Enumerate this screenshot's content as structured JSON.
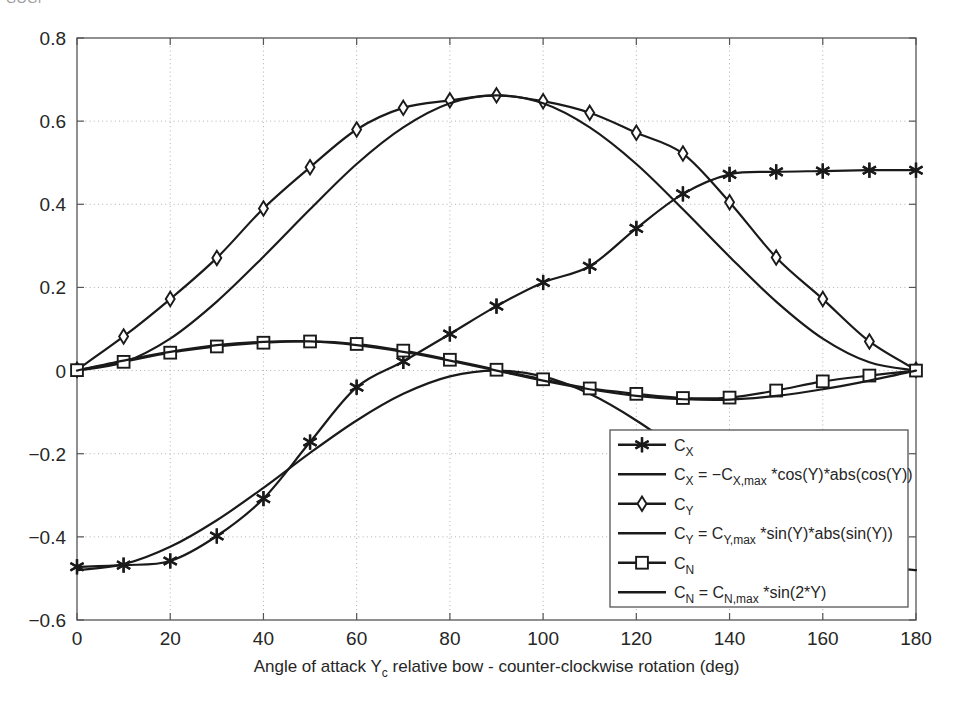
{
  "clipped_header_text": "GOGI",
  "chart_data": {
    "type": "line",
    "title": "",
    "xlabel": "Angle of attack Yₑ relative bow - counter-clockwise rotation (deg)",
    "xlabel_parts": {
      "pre": "Angle of attack Y",
      "sub": "c",
      "post": " relative bow - counter-clockwise rotation (deg)"
    },
    "ylabel": "",
    "xlim": [
      0,
      180
    ],
    "ylim": [
      -0.6,
      0.8
    ],
    "xticks": [
      0,
      20,
      40,
      60,
      80,
      100,
      120,
      140,
      160,
      180
    ],
    "xtick_labels": [
      "0",
      "20",
      "40",
      "60",
      "80",
      "100",
      "120",
      "140",
      "160",
      "180"
    ],
    "yticks": [
      -0.6,
      -0.4,
      -0.2,
      0,
      0.2,
      0.4,
      0.6,
      0.8
    ],
    "ytick_labels": [
      "-0.6",
      "-0.4",
      "-0.2",
      "0",
      "0.2",
      "0.4",
      "0.6",
      "0.8"
    ],
    "grid": true,
    "grid_style": "dotted",
    "legend_position": "lower-right",
    "x": [
      0,
      10,
      20,
      30,
      40,
      50,
      60,
      70,
      80,
      90,
      100,
      110,
      120,
      130,
      140,
      150,
      160,
      170,
      180
    ],
    "series": [
      {
        "name": "C_X",
        "legend": "Cₓ",
        "marker": "asterisk-marker",
        "style": "marker-line",
        "values": [
          -0.472,
          -0.468,
          -0.458,
          -0.398,
          -0.308,
          -0.172,
          -0.04,
          0.022,
          0.088,
          0.155,
          0.212,
          0.251,
          0.342,
          0.425,
          0.472,
          0.478,
          0.48,
          0.482,
          0.482
        ]
      },
      {
        "name": "C_X_fit",
        "legend": "Cₓ = −Cₓ,ₘₐₓ*cos(Y)*abs(cos(Y))",
        "legend_parts": {
          "pre": "C",
          "sub1": "X",
          "mid": " = −C",
          "sub2": "X,max",
          "post": " *cos(Y)*abs(cos(Y))"
        },
        "marker": "none",
        "style": "line",
        "formula": "-Cx_max*cos(Y)*abs(cos(Y))",
        "amplitude": 0.48,
        "values": [
          -0.48,
          -0.466,
          -0.424,
          -0.36,
          -0.282,
          -0.198,
          -0.12,
          -0.056,
          -0.014,
          0.0,
          -0.014,
          -0.056,
          -0.12,
          -0.198,
          -0.282,
          -0.36,
          -0.424,
          -0.466,
          -0.48
        ]
      },
      {
        "name": "C_Y",
        "legend": "Cᵧ",
        "marker": "diamond-marker",
        "style": "marker-line",
        "values": [
          0.002,
          0.082,
          0.172,
          0.271,
          0.39,
          0.489,
          0.58,
          0.632,
          0.65,
          0.662,
          0.648,
          0.62,
          0.572,
          0.522,
          0.405,
          0.272,
          0.172,
          0.07,
          0.002
        ]
      },
      {
        "name": "C_Y_fit",
        "legend": "Cᵧ = Cᵧ,ₘₐₓ*sin(Y)*abs(sin(Y))",
        "legend_parts": {
          "pre": "C",
          "sub1": "Y",
          "mid": " = C",
          "sub2": "Y,max",
          "post": " *sin(Y)*abs(sin(Y))"
        },
        "marker": "none",
        "style": "line",
        "formula": "Cy_max*sin(Y)*abs(sin(Y))",
        "amplitude": 0.662,
        "values": [
          0.0,
          0.02,
          0.077,
          0.166,
          0.274,
          0.388,
          0.497,
          0.585,
          0.643,
          0.662,
          0.643,
          0.585,
          0.497,
          0.388,
          0.274,
          0.166,
          0.077,
          0.02,
          0.0
        ]
      },
      {
        "name": "C_N",
        "legend": "Cₙ",
        "marker": "square-marker",
        "style": "marker-line",
        "values": [
          0.001,
          0.021,
          0.043,
          0.058,
          0.067,
          0.07,
          0.064,
          0.048,
          0.026,
          0.002,
          -0.021,
          -0.043,
          -0.056,
          -0.066,
          -0.065,
          -0.048,
          -0.026,
          -0.012,
          0.0
        ]
      },
      {
        "name": "C_N_fit",
        "legend": "Cₙ = Cₙ,ₘₐₓ*sin(2*Y)",
        "legend_parts": {
          "pre": "C",
          "sub1": "N",
          "mid": " = C",
          "sub2": "N,max",
          "post": " *sin(2*Y)"
        },
        "marker": "none",
        "style": "line",
        "formula": "Cn_max*sin(2*Y)",
        "amplitude": 0.07,
        "values": [
          0.0,
          0.024,
          0.045,
          0.061,
          0.069,
          0.07,
          0.061,
          0.045,
          0.024,
          0.0,
          -0.024,
          -0.045,
          -0.061,
          -0.069,
          -0.07,
          -0.061,
          -0.045,
          -0.024,
          0.0
        ]
      }
    ],
    "legend_entries": [
      {
        "label": "Cₓ",
        "marker": "asterisk-marker"
      },
      {
        "label": "Cₓ = −Cₓ,ₘₐₓ *cos(Y)*abs(cos(Y))",
        "marker": "none"
      },
      {
        "label": "Cᵧ",
        "marker": "diamond-marker"
      },
      {
        "label": "Cᵧ = Cᵧ,ₘₐₓ *sin(Y)*abs(sin(Y))",
        "marker": "none"
      },
      {
        "label": "Cₙ",
        "marker": "square-marker"
      },
      {
        "label": "Cₙ = Cₙ,ₘₐₓ *sin(2*Y)",
        "marker": "none"
      }
    ],
    "colors": {
      "line": "#1a1a1a",
      "grid": "#a8a8a8",
      "axis": "#555555",
      "background": "#ffffff"
    }
  }
}
